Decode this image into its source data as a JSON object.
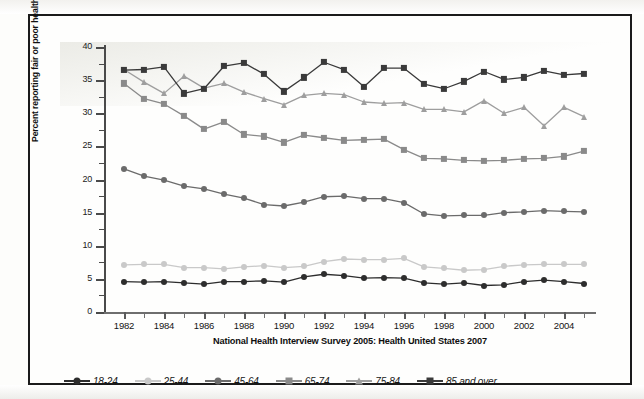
{
  "figure": {
    "source_caption": "National Health Interview Survey 2005: Health United States 2007",
    "y_axis_title": "Percent reporting fair or poor health"
  },
  "chart_data": {
    "type": "line",
    "title": "",
    "subtitle": "",
    "xlabel": "",
    "ylabel": "Percent reporting fair or poor health",
    "annotations": [
      "National Health Interview Survey 2005: Health United States 2007"
    ],
    "grid": false,
    "legend_position": "bottom-left",
    "xlim": [
      1981,
      2005.5
    ],
    "ylim": [
      0,
      40
    ],
    "ytick_values": [
      0,
      5,
      10,
      15,
      20,
      25,
      30,
      35,
      40
    ],
    "ytick_labels": [
      "0",
      "5",
      "10",
      "15",
      "20",
      "25",
      "30",
      "35",
      "40"
    ],
    "y_minor_tick_step": 2.5,
    "xtick_values": [
      1982,
      1984,
      1986,
      1988,
      1990,
      1992,
      1994,
      1996,
      1998,
      2000,
      2002,
      2004
    ],
    "xtick_labels": [
      "1982",
      "1984",
      "1986",
      "1988",
      "1990",
      "1992",
      "1994",
      "1996",
      "1998",
      "2000",
      "2002",
      "2004"
    ],
    "x": [
      1982,
      1983,
      1984,
      1985,
      1986,
      1987,
      1988,
      1989,
      1990,
      1991,
      1992,
      1993,
      1994,
      1995,
      1996,
      1997,
      1998,
      1999,
      2000,
      2001,
      2002,
      2003,
      2004,
      2005
    ],
    "series": [
      {
        "name": "18-24",
        "color": "#2d2d2d",
        "marker": "circle",
        "values": [
          4.6,
          4.5,
          4.6,
          4.4,
          4.2,
          4.6,
          4.6,
          4.7,
          4.5,
          5.3,
          5.7,
          5.5,
          5.1,
          5.2,
          5.1,
          4.4,
          4.2,
          4.4,
          4.0,
          4.1,
          4.6,
          4.8,
          4.6,
          4.3
        ]
      },
      {
        "name": "25-44",
        "color": "#c9c9c9",
        "marker": "circle",
        "values": [
          7.1,
          7.2,
          7.2,
          6.7,
          6.7,
          6.5,
          6.8,
          7.0,
          6.7,
          6.9,
          7.6,
          8.0,
          7.9,
          7.9,
          8.1,
          6.8,
          6.6,
          6.3,
          6.4,
          6.9,
          7.1,
          7.2,
          7.2,
          7.2
        ]
      },
      {
        "name": "45-64",
        "color": "#6b6b6b",
        "marker": "circle",
        "values": [
          21.6,
          20.5,
          19.9,
          19.0,
          18.6,
          17.8,
          17.2,
          16.2,
          16.0,
          16.6,
          17.4,
          17.5,
          17.1,
          17.1,
          16.5,
          14.8,
          14.5,
          14.6,
          14.6,
          15.0,
          15.1,
          15.3,
          15.2,
          15.1
        ]
      },
      {
        "name": "65-74",
        "color": "#8a8a8a",
        "marker": "square",
        "values": [
          34.5,
          32.2,
          31.4,
          29.6,
          27.6,
          28.7,
          26.8,
          26.5,
          25.6,
          26.7,
          26.3,
          25.9,
          26.0,
          26.1,
          24.5,
          23.2,
          23.1,
          22.9,
          22.8,
          22.9,
          23.1,
          23.2,
          23.5,
          24.3
        ]
      },
      {
        "name": "75-84",
        "color": "#9e9e9e",
        "marker": "triangle",
        "values": [
          36.6,
          34.7,
          33.0,
          35.6,
          33.8,
          34.5,
          33.2,
          32.2,
          31.3,
          32.7,
          33.0,
          32.8,
          31.7,
          31.5,
          31.6,
          30.6,
          30.6,
          30.2,
          31.9,
          30.0,
          30.9,
          28.1,
          30.9,
          29.5
        ]
      },
      {
        "name": "85 and over",
        "color": "#3a3a3a",
        "marker": "square",
        "values": [
          36.5,
          36.6,
          37.0,
          33.0,
          33.7,
          37.1,
          37.6,
          35.9,
          33.3,
          35.4,
          37.7,
          36.6,
          34.0,
          36.8,
          36.8,
          34.4,
          33.7,
          34.8,
          36.3,
          35.1,
          35.4,
          36.4,
          35.8,
          36.0
        ]
      }
    ]
  }
}
